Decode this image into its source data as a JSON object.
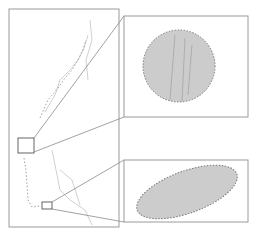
{
  "figure": {
    "type": "map-with-zoom-insets",
    "main_map": {
      "label": "overview map"
    },
    "insets": [
      {
        "id": "inset-top",
        "shape": "circle",
        "label": "zoomed region 1"
      },
      {
        "id": "inset-bottom",
        "shape": "ellipse",
        "label": "zoomed region 2"
      }
    ],
    "colors": {
      "frame": "#9a9a9a",
      "region_fill": "#c8c8c8",
      "region_outline": "#777777",
      "features": "#b0b0b0"
    }
  }
}
